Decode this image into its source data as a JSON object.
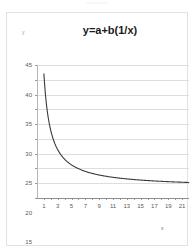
{
  "top_caption": "worksheet",
  "chart": {
    "title": "y=a+b(1/x)",
    "y_axis_label": "y",
    "x_axis_label": "x"
  },
  "chart_data": {
    "type": "line",
    "title": "y=a+b(1/x)",
    "xlabel": "x",
    "ylabel": "y",
    "xlim": [
      0,
      22
    ],
    "ylim": [
      0,
      45
    ],
    "grid": true,
    "legend": false,
    "x_ticks": [
      1,
      2,
      3,
      4,
      5,
      6,
      7,
      8,
      9,
      10,
      11,
      12,
      13,
      14,
      15,
      16,
      17,
      18,
      19,
      20,
      21
    ],
    "x_tick_labels": [
      "1",
      "",
      "3",
      "",
      "5",
      "",
      "7",
      "",
      "9",
      "",
      "11",
      "",
      "13",
      "",
      "15",
      "",
      "17",
      "",
      "19",
      "",
      "21"
    ],
    "y_ticks": [
      0,
      5,
      10,
      15,
      20,
      25,
      30,
      35,
      40,
      45
    ],
    "y_tick_labels": [
      "0",
      "5",
      "10",
      "15",
      "20",
      "25",
      "30",
      "35",
      "40",
      "45"
    ],
    "equation": "y = a + b(1/x)",
    "parameters": {
      "a": 3.5,
      "b": 38.5
    },
    "series": [
      {
        "name": "y=a+b(1/x)",
        "color": "#3a3a3a",
        "x": [
          1,
          2,
          3,
          4,
          5,
          6,
          7,
          8,
          9,
          10,
          11,
          12,
          13,
          14,
          15,
          16,
          17,
          18,
          19,
          20,
          21,
          22
        ],
        "values": [
          42.0,
          22.8,
          16.3,
          13.1,
          11.2,
          9.9,
          9.0,
          8.3,
          7.8,
          7.4,
          7.0,
          6.7,
          6.5,
          6.3,
          6.1,
          5.9,
          5.8,
          5.6,
          5.5,
          5.4,
          5.3,
          5.3
        ]
      }
    ]
  }
}
